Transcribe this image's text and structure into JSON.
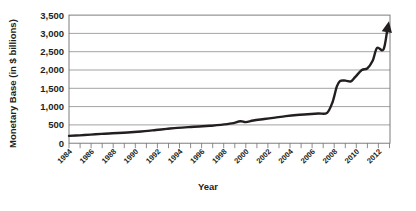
{
  "chart_data": {
    "type": "line",
    "title": "",
    "xlabel": "Year",
    "ylabel": "Monetary Base (in $ billions)",
    "xlim": [
      1984,
      2013.6
    ],
    "ylim": [
      0,
      3500
    ],
    "grid": true,
    "legend": null,
    "y_ticks": [
      0,
      500,
      1000,
      1500,
      2000,
      2500,
      3000,
      3500
    ],
    "y_tick_labels": [
      "0",
      "500",
      "1,000",
      "1,500",
      "2,000",
      "2,500",
      "3,000",
      "3,500"
    ],
    "x_tick_labels": [
      "1984",
      "1986",
      "1988",
      "1990",
      "1992",
      "1994",
      "1996",
      "1998",
      "2000",
      "2002",
      "2004",
      "2006",
      "2008",
      "2010",
      "2012"
    ],
    "x_minor_ticks": [
      1984,
      1985,
      1986,
      1987,
      1988,
      1989,
      1990,
      1991,
      1992,
      1993,
      1994,
      1995,
      1996,
      1997,
      1998,
      1999,
      2000,
      2001,
      2002,
      2003,
      2004,
      2005,
      2006,
      2007,
      2008,
      2009,
      2010,
      2011,
      2012,
      2013
    ],
    "x": [
      1984,
      1985,
      1986,
      1987,
      1988,
      1989,
      1990,
      1991,
      1992,
      1993,
      1994,
      1995,
      1996,
      1997,
      1998,
      1999,
      1999.8,
      2000.3,
      2001,
      2002,
      2003,
      2004,
      2005,
      2006,
      2007,
      2007.8,
      2008.3,
      2008.7,
      2009,
      2009.5,
      2010,
      2010.4,
      2011,
      2011.5,
      2012,
      2012.4,
      2013,
      2013.5
    ],
    "y": [
      200,
      215,
      235,
      255,
      270,
      285,
      305,
      330,
      360,
      390,
      420,
      440,
      455,
      475,
      500,
      540,
      600,
      575,
      620,
      660,
      700,
      740,
      770,
      790,
      810,
      830,
      1120,
      1550,
      1700,
      1710,
      1690,
      1810,
      2000,
      2040,
      2250,
      2600,
      2560,
      3330
    ],
    "series_name": "Monetary Base",
    "arrow_terminus": true,
    "line_color": "#231f20",
    "grid_color": "#8c8c8c",
    "axis_color": "#6e6e6e",
    "background_color": "#ffffff"
  }
}
